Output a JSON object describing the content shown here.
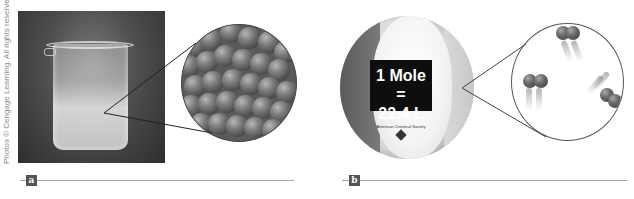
{
  "figure": {
    "credit": "Photos © Cengage Learning. All rights reserved.",
    "panels": [
      {
        "tag": "a",
        "description": "Glass beaker of liquid with magnified view of densely packed molecules",
        "magnified_view": "densely packed diatomic molecules (liquid)"
      },
      {
        "tag": "b",
        "description": "Beach ball with label and magnified view of widely spaced gas molecules",
        "ball_label_line1": "1 Mole =",
        "ball_label_line2": "22.4 L",
        "ball_small_text": "American Chemical Society",
        "magnified_view": "three diatomic molecules in motion (gas)"
      }
    ]
  },
  "colors": {
    "tag_bg": "#555555",
    "rule": "#a8a8a8",
    "label_bg": "#0e0e0e"
  }
}
